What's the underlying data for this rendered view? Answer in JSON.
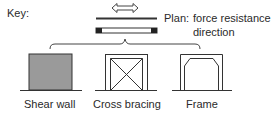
{
  "key": {
    "label": "Key:"
  },
  "plan": {
    "label": "Plan:",
    "description_line1": "force resistance",
    "description_line2": "direction"
  },
  "elements": [
    {
      "id": "shear-wall",
      "label": "Shear wall",
      "fill": "#9a9a9a"
    },
    {
      "id": "cross-bracing",
      "label": "Cross bracing"
    },
    {
      "id": "frame",
      "label": "Frame"
    }
  ],
  "colors": {
    "stroke": "#333333",
    "wall_fill": "#9a9a9a",
    "background": "#ffffff"
  }
}
